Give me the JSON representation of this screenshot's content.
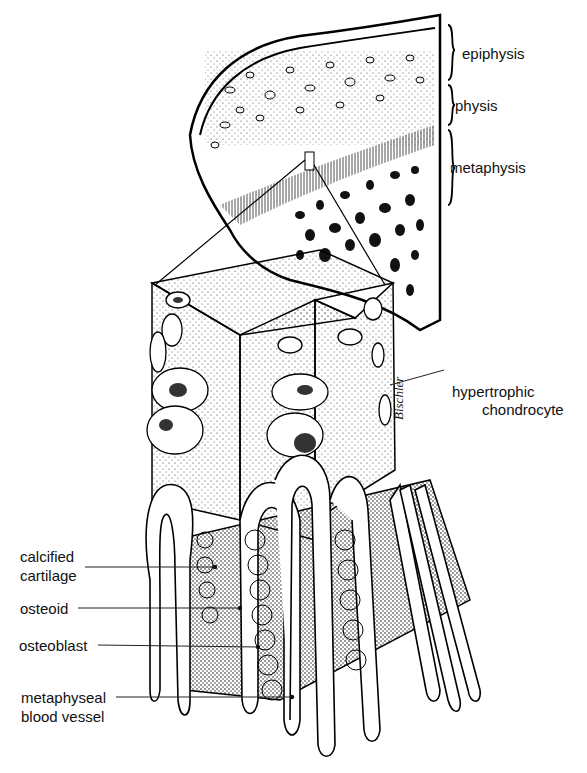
{
  "figure": {
    "signature": "Bischler"
  },
  "zone_labels": [
    {
      "id": "epiphysis",
      "text": "epiphysis"
    },
    {
      "id": "physis",
      "text": "physis"
    },
    {
      "id": "metaphysis",
      "text": "metaphysis"
    }
  ],
  "callouts": {
    "hypertrophic_chondrocyte": {
      "line1": "hypertrophic",
      "line2": "chondrocyte"
    },
    "calcified_cartilage": {
      "line1": "calcified",
      "line2": "cartilage"
    },
    "osteoid": {
      "line1": "osteoid"
    },
    "osteoblast": {
      "line1": "osteoblast"
    },
    "metaphyseal_blood_vessel": {
      "line1": "metaphyseal",
      "line2": "blood vessel"
    }
  }
}
